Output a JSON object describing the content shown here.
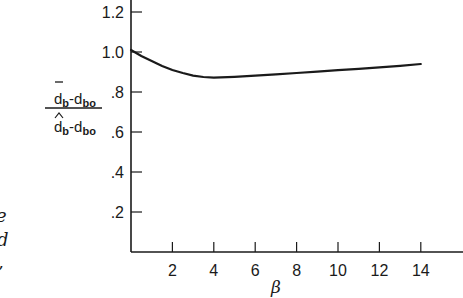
{
  "chart_data": {
    "type": "line",
    "title": "",
    "xlabel": "β",
    "ylabel": "(d̄_b − d_bo) / (d̂_b − d_bo)",
    "ylabel_parts": {
      "numerator_main": "d",
      "numerator_sub": "b",
      "numerator_dash": "-d",
      "numerator_sub2": "bo",
      "denominator_main": "d",
      "denominator_sub": "b",
      "denominator_dash": "-d",
      "denominator_sub2": "bo"
    },
    "xlim": [
      0,
      15.5
    ],
    "ylim": [
      0,
      1.3
    ],
    "x_ticks": [
      2,
      4,
      6,
      8,
      10,
      12,
      14
    ],
    "x_tick_labels": [
      "2",
      "4",
      "6",
      "8",
      "10",
      "12",
      "14"
    ],
    "y_ticks": [
      0.2,
      0.4,
      0.6,
      0.8,
      1.0,
      1.2
    ],
    "y_tick_labels": [
      ".2",
      ".4",
      ".6",
      ".8",
      "1.0",
      "1.2"
    ],
    "grid": false,
    "legend": null,
    "series": [
      {
        "name": "ratio",
        "x": [
          0,
          0.5,
          1,
          1.5,
          2,
          2.5,
          3,
          3.5,
          4,
          5,
          6,
          7,
          8,
          9,
          10,
          11,
          12,
          13,
          14
        ],
        "values": [
          1.01,
          0.98,
          0.955,
          0.93,
          0.91,
          0.895,
          0.882,
          0.875,
          0.872,
          0.876,
          0.882,
          0.888,
          0.895,
          0.902,
          0.909,
          0.916,
          0.923,
          0.931,
          0.94
        ]
      }
    ]
  },
  "page": {
    "left_text_fragments": [
      "e",
      "d",
      ","
    ]
  }
}
